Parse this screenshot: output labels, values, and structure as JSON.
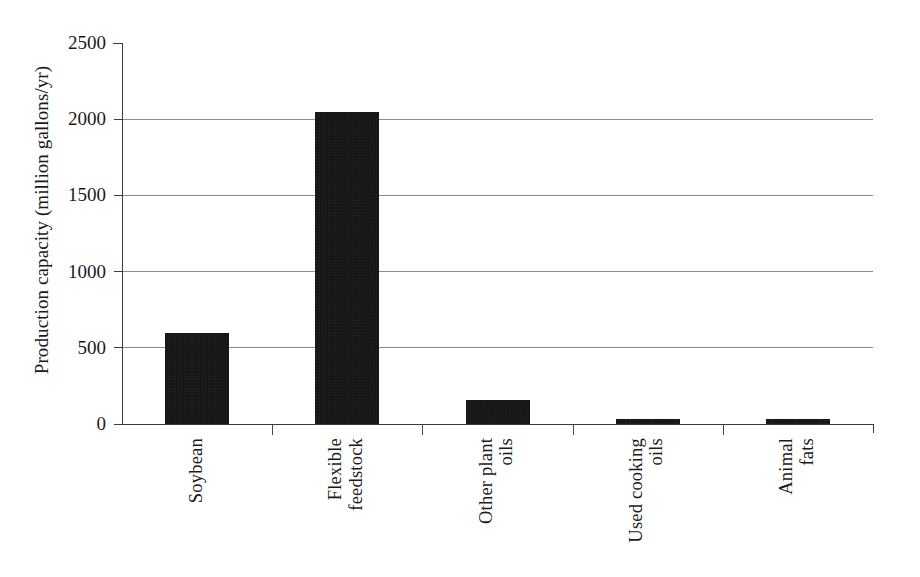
{
  "chart_data": {
    "type": "bar",
    "title": "",
    "subtitle": "",
    "xlabel": "",
    "ylabel": "Production capacity (million gallons/yr)",
    "categories": [
      "Soybean",
      "Flexible feedstock",
      "Other plant oils",
      "Used cooking oils",
      "Animal fats"
    ],
    "category_lines": [
      [
        "Soybean"
      ],
      [
        "Flexible",
        "feedstock"
      ],
      [
        "Other plant",
        "oils"
      ],
      [
        "Used cooking",
        "oils"
      ],
      [
        "Animal",
        "fats"
      ]
    ],
    "values": [
      600,
      2050,
      155,
      35,
      35
    ],
    "ylim": [
      0,
      2500
    ],
    "y_ticks": [
      0,
      500,
      1000,
      1500,
      2000,
      2500
    ],
    "y_tick_labels": [
      "0",
      "500",
      "1000",
      "1500",
      "2000",
      "2500"
    ],
    "gridlines_at": [
      500,
      1000,
      1500,
      2000
    ],
    "grid": true,
    "legend": false,
    "legend_position": "none",
    "bar_color": "#171717",
    "grid_color": "#8d8d8d",
    "axis_color": "#3a3a3a",
    "background_color": "#ffffff",
    "x_tick_label_rotation": 90
  },
  "axis": {
    "y_title": "Production capacity (million gallons/yr)"
  }
}
